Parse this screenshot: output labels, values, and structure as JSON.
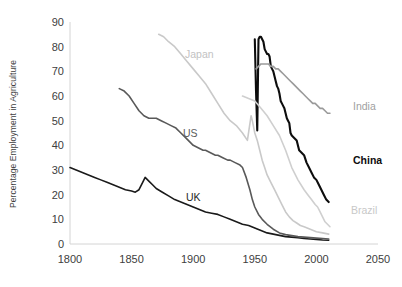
{
  "chart_data": {
    "type": "line",
    "title": "",
    "xlabel": "",
    "ylabel": "Percentage Employment in Agriculture",
    "xlim": [
      1800,
      2050
    ],
    "ylim": [
      0,
      90
    ],
    "xticks": [
      "1800",
      "1850",
      "1900",
      "1950",
      "2000",
      "2050"
    ],
    "yticks": [
      "0",
      "10",
      "20",
      "30",
      "40",
      "50",
      "60",
      "70",
      "80",
      "90"
    ],
    "grid": false,
    "legend_position": "inline-labels",
    "series": [
      {
        "name": "UK",
        "color": "#1a1a1a",
        "width": 1.6,
        "label_x": 1800,
        "label_y": 0,
        "points": [
          [
            1800,
            31
          ],
          [
            1805,
            30
          ],
          [
            1810,
            29
          ],
          [
            1815,
            28
          ],
          [
            1820,
            27
          ],
          [
            1825,
            26
          ],
          [
            1830,
            25
          ],
          [
            1835,
            24
          ],
          [
            1840,
            23
          ],
          [
            1845,
            22
          ],
          [
            1850,
            21.5
          ],
          [
            1853,
            21
          ],
          [
            1856,
            22
          ],
          [
            1859,
            25
          ],
          [
            1861,
            27
          ],
          [
            1864,
            25.5
          ],
          [
            1867,
            24
          ],
          [
            1870,
            22.5
          ],
          [
            1875,
            21
          ],
          [
            1880,
            19.5
          ],
          [
            1885,
            18
          ],
          [
            1890,
            17
          ],
          [
            1895,
            16
          ],
          [
            1900,
            15
          ],
          [
            1905,
            14
          ],
          [
            1910,
            13
          ],
          [
            1915,
            12.5
          ],
          [
            1920,
            12
          ],
          [
            1925,
            11
          ],
          [
            1930,
            10
          ],
          [
            1935,
            9
          ],
          [
            1940,
            8
          ],
          [
            1945,
            7.5
          ],
          [
            1950,
            6.5
          ],
          [
            1955,
            5.5
          ],
          [
            1960,
            4.5
          ],
          [
            1965,
            4
          ],
          [
            1970,
            3.5
          ],
          [
            1975,
            3
          ],
          [
            1980,
            2.8
          ],
          [
            1985,
            2.5
          ],
          [
            1990,
            2.2
          ],
          [
            1995,
            2
          ],
          [
            2000,
            1.8
          ],
          [
            2005,
            1.6
          ],
          [
            2010,
            1.5
          ]
        ]
      },
      {
        "name": "US",
        "color": "#595959",
        "width": 1.6,
        "label_x": 1895,
        "label_y": 45,
        "points": [
          [
            1840,
            63
          ],
          [
            1844,
            62
          ],
          [
            1848,
            60
          ],
          [
            1852,
            57
          ],
          [
            1856,
            54
          ],
          [
            1860,
            52
          ],
          [
            1864,
            51
          ],
          [
            1868,
            51
          ],
          [
            1870,
            51
          ],
          [
            1874,
            50
          ],
          [
            1878,
            49
          ],
          [
            1882,
            48
          ],
          [
            1886,
            47
          ],
          [
            1890,
            45
          ],
          [
            1894,
            43
          ],
          [
            1898,
            41
          ],
          [
            1900,
            40
          ],
          [
            1904,
            39
          ],
          [
            1908,
            38
          ],
          [
            1910,
            38
          ],
          [
            1914,
            37
          ],
          [
            1918,
            36
          ],
          [
            1920,
            36
          ],
          [
            1924,
            35
          ],
          [
            1928,
            34
          ],
          [
            1930,
            34
          ],
          [
            1934,
            33
          ],
          [
            1938,
            32
          ],
          [
            1940,
            31
          ],
          [
            1943,
            27
          ],
          [
            1946,
            22
          ],
          [
            1948,
            18
          ],
          [
            1950,
            15
          ],
          [
            1953,
            12
          ],
          [
            1956,
            10
          ],
          [
            1960,
            8
          ],
          [
            1965,
            6
          ],
          [
            1970,
            4.5
          ],
          [
            1975,
            3.8
          ],
          [
            1980,
            3.4
          ],
          [
            1985,
            3
          ],
          [
            1990,
            2.8
          ],
          [
            1995,
            2.6
          ],
          [
            2000,
            2.4
          ],
          [
            2005,
            2.2
          ],
          [
            2010,
            2
          ]
        ]
      },
      {
        "name": "Japan",
        "color": "#c9c9c9",
        "width": 1.6,
        "label_x": 1900,
        "label_y": 76,
        "points": [
          [
            1872,
            85
          ],
          [
            1876,
            84
          ],
          [
            1880,
            82
          ],
          [
            1885,
            80
          ],
          [
            1890,
            77
          ],
          [
            1895,
            74
          ],
          [
            1900,
            71
          ],
          [
            1905,
            68
          ],
          [
            1910,
            65
          ],
          [
            1915,
            61
          ],
          [
            1920,
            57
          ],
          [
            1925,
            53
          ],
          [
            1930,
            50
          ],
          [
            1935,
            48
          ],
          [
            1940,
            45
          ],
          [
            1944,
            42
          ],
          [
            1947,
            52
          ],
          [
            1948,
            50
          ],
          [
            1950,
            45
          ],
          [
            1952,
            42
          ],
          [
            1954,
            38
          ],
          [
            1956,
            34
          ],
          [
            1958,
            31
          ],
          [
            1960,
            28
          ],
          [
            1963,
            25
          ],
          [
            1966,
            22
          ],
          [
            1969,
            19
          ],
          [
            1972,
            16
          ],
          [
            1975,
            13
          ],
          [
            1978,
            11
          ],
          [
            1981,
            9.5
          ],
          [
            1984,
            8.5
          ],
          [
            1987,
            7.5
          ],
          [
            1990,
            7
          ],
          [
            1995,
            6
          ],
          [
            2000,
            5
          ],
          [
            2005,
            4.5
          ],
          [
            2010,
            4
          ]
        ]
      },
      {
        "name": "China",
        "color": "#0d0d0d",
        "width": 2.1,
        "label_x": 2012,
        "label_y": 35,
        "points": [
          [
            1950,
            83
          ],
          [
            1951,
            62
          ],
          [
            1952,
            46
          ],
          [
            1953,
            83
          ],
          [
            1954,
            84
          ],
          [
            1955,
            84
          ],
          [
            1956,
            83
          ],
          [
            1957,
            82
          ],
          [
            1958,
            79
          ],
          [
            1959,
            78
          ],
          [
            1960,
            77
          ],
          [
            1961,
            77
          ],
          [
            1962,
            76
          ],
          [
            1963,
            72
          ],
          [
            1964,
            71
          ],
          [
            1965,
            70
          ],
          [
            1966,
            68
          ],
          [
            1967,
            66
          ],
          [
            1968,
            64
          ],
          [
            1969,
            63
          ],
          [
            1970,
            61
          ],
          [
            1971,
            58
          ],
          [
            1972,
            57
          ],
          [
            1973,
            56
          ],
          [
            1974,
            55
          ],
          [
            1975,
            53
          ],
          [
            1976,
            51
          ],
          [
            1977,
            50
          ],
          [
            1978,
            49
          ],
          [
            1979,
            45
          ],
          [
            1980,
            44
          ],
          [
            1982,
            43
          ],
          [
            1984,
            42
          ],
          [
            1986,
            38
          ],
          [
            1988,
            37
          ],
          [
            1990,
            36
          ],
          [
            1992,
            33
          ],
          [
            1994,
            31
          ],
          [
            1996,
            29
          ],
          [
            1998,
            27
          ],
          [
            2000,
            26
          ],
          [
            2002,
            24
          ],
          [
            2004,
            22
          ],
          [
            2006,
            20
          ],
          [
            2008,
            18
          ],
          [
            2010,
            17
          ]
        ]
      },
      {
        "name": "India",
        "color": "#9a9a9a",
        "width": 1.6,
        "label_x": 2012,
        "label_y": 57,
        "points": [
          [
            1951,
            71
          ],
          [
            1953,
            72
          ],
          [
            1955,
            73
          ],
          [
            1957,
            73
          ],
          [
            1959,
            73
          ],
          [
            1961,
            73
          ],
          [
            1963,
            72
          ],
          [
            1965,
            72
          ],
          [
            1967,
            71
          ],
          [
            1969,
            71
          ],
          [
            1971,
            70
          ],
          [
            1973,
            69
          ],
          [
            1975,
            68
          ],
          [
            1977,
            67
          ],
          [
            1979,
            66
          ],
          [
            1981,
            65
          ],
          [
            1983,
            64
          ],
          [
            1985,
            63
          ],
          [
            1987,
            62
          ],
          [
            1989,
            61
          ],
          [
            1991,
            60
          ],
          [
            1993,
            59
          ],
          [
            1995,
            58
          ],
          [
            1997,
            57
          ],
          [
            1999,
            57
          ],
          [
            2001,
            56
          ],
          [
            2003,
            55
          ],
          [
            2005,
            55
          ],
          [
            2007,
            54
          ],
          [
            2009,
            53
          ],
          [
            2011,
            53
          ]
        ]
      },
      {
        "name": "Brazil",
        "color": "#cfcfcf",
        "width": 1.6,
        "label_x": 2012,
        "label_y": 14,
        "points": [
          [
            1940,
            60
          ],
          [
            1945,
            59
          ],
          [
            1950,
            58
          ],
          [
            1955,
            55
          ],
          [
            1960,
            52
          ],
          [
            1965,
            48
          ],
          [
            1970,
            44
          ],
          [
            1975,
            38
          ],
          [
            1980,
            31
          ],
          [
            1985,
            26
          ],
          [
            1990,
            22
          ],
          [
            1993,
            20
          ],
          [
            1996,
            18
          ],
          [
            1999,
            16
          ],
          [
            2001,
            15
          ],
          [
            2003,
            13
          ],
          [
            2005,
            11
          ],
          [
            2007,
            9
          ],
          [
            2009,
            8
          ],
          [
            2011,
            7
          ]
        ]
      }
    ]
  },
  "labels": {
    "japan": "Japan",
    "us": "US",
    "uk": "UK",
    "india": "India",
    "china": "China",
    "brazil": "Brazil"
  }
}
